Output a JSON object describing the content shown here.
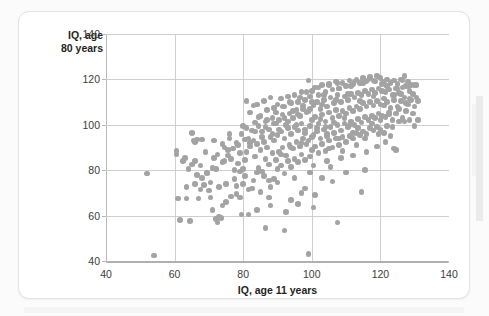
{
  "chart_data": {
    "type": "scatter",
    "title": "",
    "xlabel": "IQ, age 11 years",
    "ylabel": "IQ, age\n80 years",
    "xlim": [
      40,
      140
    ],
    "ylim": [
      40,
      140
    ],
    "xticks": [
      40,
      60,
      80,
      100,
      120,
      140
    ],
    "yticks": [
      40,
      60,
      80,
      100,
      120,
      140
    ],
    "grid": true,
    "legend": "none",
    "point_color": "#a3a3a3",
    "point_count": 497,
    "correlation_note": "strong positive association",
    "points": [
      [
        52.0,
        78.5
      ],
      [
        54.0,
        42.5
      ],
      [
        60.5,
        87.0
      ],
      [
        61.0,
        67.5
      ],
      [
        61.5,
        58.0
      ],
      [
        63.5,
        67.5
      ],
      [
        64.5,
        57.5
      ],
      [
        65.0,
        96.5
      ],
      [
        65.5,
        93.0
      ],
      [
        66.0,
        92.5
      ],
      [
        66.5,
        93.5
      ],
      [
        66.0,
        84.0
      ],
      [
        67.5,
        71.5
      ],
      [
        67.0,
        67.5
      ],
      [
        68.0,
        93.5
      ],
      [
        68.5,
        73.5
      ],
      [
        69.5,
        78.5
      ],
      [
        70.0,
        71.0
      ],
      [
        70.5,
        68.0
      ],
      [
        71.5,
        93.0
      ],
      [
        71.0,
        62.5
      ],
      [
        72.0,
        58.5
      ],
      [
        72.5,
        57.0
      ],
      [
        72.0,
        80.5
      ],
      [
        73.0,
        59.5
      ],
      [
        73.5,
        59.0
      ],
      [
        74.0,
        91.5
      ],
      [
        74.5,
        84.0
      ],
      [
        74.0,
        64.5
      ],
      [
        75.5,
        86.5
      ],
      [
        75.0,
        74.0
      ],
      [
        76.0,
        96.0
      ],
      [
        76.5,
        68.5
      ],
      [
        77.0,
        89.5
      ],
      [
        77.5,
        80.0
      ],
      [
        78.0,
        92.0
      ],
      [
        78.5,
        83.0
      ],
      [
        79.0,
        79.5
      ],
      [
        79.5,
        60.5
      ],
      [
        79.0,
        68.0
      ],
      [
        80.0,
        99.5
      ],
      [
        80.5,
        84.5
      ],
      [
        80.0,
        80.5
      ],
      [
        80.5,
        77.5
      ],
      [
        81.0,
        110.5
      ],
      [
        81.5,
        94.0
      ],
      [
        81.0,
        88.0
      ],
      [
        82.0,
        105.5
      ],
      [
        82.5,
        97.5
      ],
      [
        82.0,
        90.5
      ],
      [
        83.0,
        108.5
      ],
      [
        83.5,
        101.0
      ],
      [
        83.0,
        93.0
      ],
      [
        83.5,
        86.0
      ],
      [
        84.0,
        109.0
      ],
      [
        84.5,
        99.5
      ],
      [
        84.0,
        91.5
      ],
      [
        84.5,
        81.0
      ],
      [
        85.0,
        104.0
      ],
      [
        85.5,
        97.0
      ],
      [
        85.0,
        89.0
      ],
      [
        85.5,
        79.5
      ],
      [
        86.0,
        110.5
      ],
      [
        86.5,
        101.5
      ],
      [
        86.0,
        92.5
      ],
      [
        86.5,
        85.0
      ],
      [
        87.0,
        106.5
      ],
      [
        87.5,
        98.0
      ],
      [
        87.0,
        90.0
      ],
      [
        87.5,
        75.5
      ],
      [
        88.0,
        112.0
      ],
      [
        88.5,
        103.0
      ],
      [
        88.0,
        94.5
      ],
      [
        88.5,
        87.5
      ],
      [
        88.0,
        72.5
      ],
      [
        89.0,
        107.5
      ],
      [
        89.5,
        100.5
      ],
      [
        89.0,
        93.0
      ],
      [
        89.5,
        84.5
      ],
      [
        89.0,
        76.0
      ],
      [
        90.0,
        109.0
      ],
      [
        90.5,
        102.0
      ],
      [
        90.0,
        95.5
      ],
      [
        90.5,
        88.0
      ],
      [
        90.0,
        80.5
      ],
      [
        91.0,
        111.5
      ],
      [
        91.5,
        104.5
      ],
      [
        91.0,
        97.0
      ],
      [
        91.5,
        90.0
      ],
      [
        91.0,
        82.0
      ],
      [
        92.0,
        108.0
      ],
      [
        92.5,
        100.0
      ],
      [
        92.0,
        94.0
      ],
      [
        92.5,
        86.5
      ],
      [
        92.0,
        78.5
      ],
      [
        93.0,
        112.5
      ],
      [
        93.5,
        105.0
      ],
      [
        93.0,
        98.5
      ],
      [
        93.5,
        91.0
      ],
      [
        93.0,
        84.0
      ],
      [
        94.0,
        109.5
      ],
      [
        94.5,
        103.0
      ],
      [
        94.0,
        96.0
      ],
      [
        94.5,
        89.5
      ],
      [
        94.0,
        81.5
      ],
      [
        95.0,
        113.0
      ],
      [
        95.5,
        106.5
      ],
      [
        95.0,
        99.0
      ],
      [
        95.5,
        92.5
      ],
      [
        95.0,
        85.0
      ],
      [
        96.0,
        110.0
      ],
      [
        96.5,
        104.0
      ],
      [
        96.0,
        97.5
      ],
      [
        96.5,
        90.5
      ],
      [
        96.0,
        83.5
      ],
      [
        97.0,
        114.5
      ],
      [
        97.5,
        107.0
      ],
      [
        97.0,
        100.5
      ],
      [
        97.5,
        94.0
      ],
      [
        97.0,
        87.0
      ],
      [
        98.0,
        111.0
      ],
      [
        98.5,
        105.5
      ],
      [
        98.0,
        98.0
      ],
      [
        98.5,
        91.5
      ],
      [
        98.0,
        84.5
      ],
      [
        99.0,
        119.5
      ],
      [
        99.5,
        112.5
      ],
      [
        99.0,
        106.0
      ],
      [
        99.5,
        99.5
      ],
      [
        99.0,
        93.0
      ],
      [
        99.5,
        86.0
      ],
      [
        99.0,
        43.0
      ],
      [
        100.0,
        115.0
      ],
      [
        100.5,
        108.5
      ],
      [
        100.0,
        102.0
      ],
      [
        100.5,
        95.5
      ],
      [
        100.0,
        89.0
      ],
      [
        100.5,
        82.0
      ],
      [
        101.0,
        116.5
      ],
      [
        101.5,
        110.0
      ],
      [
        101.0,
        103.5
      ],
      [
        101.5,
        97.0
      ],
      [
        101.0,
        90.5
      ],
      [
        102.0,
        113.0
      ],
      [
        102.5,
        107.0
      ],
      [
        102.0,
        100.5
      ],
      [
        102.5,
        94.0
      ],
      [
        102.0,
        87.5
      ],
      [
        103.0,
        117.5
      ],
      [
        103.5,
        111.0
      ],
      [
        103.0,
        104.5
      ],
      [
        103.5,
        98.0
      ],
      [
        103.0,
        91.5
      ],
      [
        104.0,
        114.5
      ],
      [
        104.5,
        108.0
      ],
      [
        104.0,
        101.5
      ],
      [
        104.5,
        95.0
      ],
      [
        104.0,
        88.5
      ],
      [
        105.0,
        118.0
      ],
      [
        105.5,
        112.0
      ],
      [
        105.0,
        105.5
      ],
      [
        105.5,
        99.0
      ],
      [
        105.0,
        93.0
      ],
      [
        106.0,
        115.5
      ],
      [
        106.5,
        109.5
      ],
      [
        106.0,
        103.0
      ],
      [
        106.5,
        96.5
      ],
      [
        106.0,
        90.0
      ],
      [
        107.0,
        119.0
      ],
      [
        107.5,
        113.0
      ],
      [
        107.0,
        106.5
      ],
      [
        107.5,
        100.0
      ],
      [
        107.0,
        94.0
      ],
      [
        107.5,
        57.0
      ],
      [
        108.0,
        116.0
      ],
      [
        108.5,
        110.0
      ],
      [
        108.0,
        104.0
      ],
      [
        108.5,
        97.5
      ],
      [
        108.0,
        91.0
      ],
      [
        109.0,
        118.5
      ],
      [
        109.5,
        112.5
      ],
      [
        109.0,
        106.0
      ],
      [
        109.5,
        100.5
      ],
      [
        109.0,
        94.5
      ],
      [
        110.0,
        117.0
      ],
      [
        110.5,
        111.0
      ],
      [
        110.0,
        105.0
      ],
      [
        110.5,
        99.0
      ],
      [
        110.0,
        92.5
      ],
      [
        111.0,
        119.5
      ],
      [
        111.5,
        113.5
      ],
      [
        111.0,
        107.5
      ],
      [
        111.5,
        101.5
      ],
      [
        111.0,
        95.0
      ],
      [
        112.0,
        118.0
      ],
      [
        112.5,
        112.0
      ],
      [
        112.0,
        106.0
      ],
      [
        112.5,
        100.0
      ],
      [
        112.0,
        94.0
      ],
      [
        113.0,
        120.0
      ],
      [
        113.5,
        114.0
      ],
      [
        113.0,
        108.0
      ],
      [
        113.5,
        102.5
      ],
      [
        113.0,
        96.5
      ],
      [
        114.0,
        118.5
      ],
      [
        114.5,
        113.0
      ],
      [
        114.0,
        107.0
      ],
      [
        114.5,
        101.0
      ],
      [
        114.0,
        95.5
      ],
      [
        115.0,
        120.5
      ],
      [
        115.5,
        115.0
      ],
      [
        115.0,
        109.5
      ],
      [
        115.5,
        103.5
      ],
      [
        115.0,
        97.0
      ],
      [
        115.5,
        80.0
      ],
      [
        116.0,
        119.0
      ],
      [
        116.5,
        113.5
      ],
      [
        116.0,
        108.0
      ],
      [
        116.5,
        102.0
      ],
      [
        116.0,
        96.0
      ],
      [
        117.0,
        121.0
      ],
      [
        117.5,
        115.5
      ],
      [
        117.0,
        110.0
      ],
      [
        117.5,
        104.0
      ],
      [
        117.0,
        98.5
      ],
      [
        118.0,
        119.5
      ],
      [
        118.5,
        114.0
      ],
      [
        118.0,
        108.5
      ],
      [
        118.5,
        103.0
      ],
      [
        118.0,
        97.5
      ],
      [
        119.0,
        121.5
      ],
      [
        119.5,
        116.0
      ],
      [
        119.0,
        110.5
      ],
      [
        119.5,
        105.0
      ],
      [
        119.0,
        99.0
      ],
      [
        120.0,
        120.5
      ],
      [
        120.5,
        115.0
      ],
      [
        120.0,
        109.0
      ],
      [
        120.5,
        104.0
      ],
      [
        120.0,
        98.0
      ],
      [
        121.0,
        119.0
      ],
      [
        121.5,
        114.5
      ],
      [
        121.0,
        108.5
      ],
      [
        121.5,
        103.5
      ],
      [
        121.0,
        96.5
      ],
      [
        122.0,
        120.0
      ],
      [
        122.5,
        115.5
      ],
      [
        122.0,
        110.0
      ],
      [
        122.5,
        105.5
      ],
      [
        122.0,
        99.5
      ],
      [
        123.0,
        118.5
      ],
      [
        123.5,
        113.0
      ],
      [
        123.0,
        107.5
      ],
      [
        123.5,
        102.0
      ],
      [
        124.0,
        119.5
      ],
      [
        124.5,
        116.0
      ],
      [
        124.0,
        111.0
      ],
      [
        124.5,
        105.0
      ],
      [
        124.0,
        89.5
      ],
      [
        124.5,
        89.0
      ],
      [
        125.0,
        118.0
      ],
      [
        125.5,
        114.0
      ],
      [
        125.0,
        108.0
      ],
      [
        125.5,
        101.5
      ],
      [
        126.0,
        120.0
      ],
      [
        126.5,
        116.5
      ],
      [
        126.0,
        110.5
      ],
      [
        126.5,
        103.0
      ],
      [
        127.0,
        121.5
      ],
      [
        127.5,
        117.0
      ],
      [
        127.0,
        112.0
      ],
      [
        127.5,
        106.0
      ],
      [
        128.0,
        119.0
      ],
      [
        128.5,
        115.0
      ],
      [
        128.0,
        109.0
      ],
      [
        128.5,
        102.0
      ],
      [
        129.0,
        117.5
      ],
      [
        129.5,
        113.5
      ],
      [
        129.0,
        111.0
      ],
      [
        130.0,
        117.5
      ],
      [
        130.5,
        112.0
      ],
      [
        130.0,
        99.5
      ],
      [
        131.0,
        110.5
      ],
      [
        86.5,
        54.5
      ],
      [
        92.0,
        53.5
      ],
      [
        98.0,
        72.0
      ],
      [
        103.0,
        76.5
      ],
      [
        105.5,
        81.5
      ],
      [
        110.0,
        79.0
      ],
      [
        114.5,
        70.5
      ],
      [
        100.5,
        63.5
      ],
      [
        96.0,
        65.0
      ],
      [
        92.5,
        61.5
      ],
      [
        88.0,
        64.5
      ],
      [
        84.0,
        62.5
      ],
      [
        81.5,
        60.5
      ],
      [
        78.0,
        69.5
      ],
      [
        75.0,
        66.0
      ],
      [
        82.5,
        72.0
      ],
      [
        85.0,
        70.5
      ],
      [
        87.5,
        68.0
      ],
      [
        94.0,
        67.0
      ],
      [
        97.0,
        70.0
      ],
      [
        101.0,
        69.0
      ],
      [
        106.0,
        75.0
      ],
      [
        108.5,
        85.5
      ],
      [
        112.0,
        86.5
      ],
      [
        116.0,
        88.0
      ],
      [
        119.0,
        90.5
      ],
      [
        121.5,
        92.5
      ],
      [
        123.0,
        95.0
      ],
      [
        109.0,
        88.5
      ],
      [
        113.0,
        91.0
      ],
      [
        104.5,
        84.0
      ],
      [
        99.5,
        79.0
      ],
      [
        95.0,
        76.5
      ],
      [
        90.0,
        74.5
      ],
      [
        86.0,
        77.5
      ],
      [
        83.0,
        75.5
      ],
      [
        80.0,
        74.0
      ],
      [
        77.5,
        76.0
      ],
      [
        73.0,
        72.5
      ],
      [
        70.5,
        74.5
      ],
      [
        68.0,
        76.5
      ],
      [
        66.5,
        78.0
      ],
      [
        64.0,
        80.5
      ],
      [
        62.5,
        84.0
      ],
      [
        69.0,
        88.0
      ],
      [
        71.5,
        85.5
      ],
      [
        74.5,
        90.0
      ],
      [
        76.0,
        94.0
      ],
      [
        79.5,
        96.0
      ],
      [
        81.0,
        98.5
      ],
      [
        84.5,
        103.5
      ],
      [
        87.0,
        102.0
      ],
      [
        89.5,
        105.5
      ],
      [
        91.5,
        108.0
      ],
      [
        93.5,
        110.0
      ],
      [
        96.5,
        112.0
      ],
      [
        98.5,
        114.5
      ],
      [
        102.0,
        116.5
      ],
      [
        105.0,
        117.5
      ],
      [
        107.5,
        118.5
      ],
      [
        111.5,
        117.0
      ],
      [
        115.0,
        118.5
      ],
      [
        118.5,
        119.0
      ],
      [
        122.0,
        117.0
      ],
      [
        125.0,
        116.0
      ],
      [
        128.0,
        117.0
      ],
      [
        130.5,
        117.5
      ],
      [
        126.5,
        119.5
      ],
      [
        120.5,
        118.0
      ],
      [
        116.5,
        120.0
      ],
      [
        112.5,
        119.0
      ],
      [
        108.0,
        116.0
      ],
      [
        103.5,
        113.0
      ],
      [
        100.0,
        110.0
      ],
      [
        97.5,
        108.5
      ],
      [
        94.5,
        106.0
      ],
      [
        92.0,
        103.0
      ],
      [
        89.0,
        100.5
      ],
      [
        86.5,
        99.0
      ],
      [
        83.5,
        97.0
      ],
      [
        80.5,
        93.5
      ],
      [
        78.5,
        91.0
      ],
      [
        75.5,
        89.0
      ],
      [
        72.5,
        87.0
      ],
      [
        67.5,
        82.0
      ],
      [
        65.0,
        82.5
      ],
      [
        63.0,
        85.5
      ],
      [
        60.5,
        88.5
      ],
      [
        102.5,
        102.5
      ],
      [
        104.0,
        99.0
      ],
      [
        106.5,
        101.0
      ],
      [
        109.5,
        103.0
      ],
      [
        111.0,
        100.0
      ],
      [
        113.5,
        98.5
      ],
      [
        117.5,
        100.5
      ],
      [
        120.0,
        102.0
      ],
      [
        122.5,
        104.5
      ],
      [
        125.5,
        107.0
      ],
      [
        127.5,
        109.5
      ],
      [
        129.5,
        105.0
      ],
      [
        131.0,
        102.0
      ],
      [
        130.0,
        108.0
      ],
      [
        128.5,
        111.5
      ],
      [
        126.0,
        113.5
      ],
      [
        124.0,
        113.0
      ],
      [
        121.0,
        111.5
      ],
      [
        118.0,
        112.5
      ],
      [
        114.0,
        110.5
      ],
      [
        110.5,
        113.5
      ],
      [
        107.0,
        111.0
      ],
      [
        103.0,
        109.0
      ],
      [
        99.5,
        107.0
      ],
      [
        96.0,
        104.5
      ],
      [
        93.0,
        101.5
      ],
      [
        90.5,
        98.0
      ],
      [
        88.5,
        96.0
      ],
      [
        85.5,
        94.5
      ],
      [
        82.0,
        92.0
      ],
      [
        79.0,
        87.5
      ],
      [
        76.5,
        85.0
      ],
      [
        74.0,
        83.5
      ],
      [
        71.0,
        81.0
      ],
      [
        69.5,
        79.0
      ],
      [
        66.0,
        74.0
      ],
      [
        63.5,
        72.5
      ],
      [
        95.5,
        100.0
      ],
      [
        98.0,
        96.5
      ],
      [
        101.5,
        98.5
      ],
      [
        104.5,
        96.0
      ],
      [
        100.0,
        94.5
      ],
      [
        97.0,
        92.0
      ],
      [
        94.0,
        90.0
      ],
      [
        91.0,
        87.0
      ],
      [
        87.5,
        82.5
      ],
      [
        84.0,
        79.0
      ],
      [
        81.5,
        71.5
      ],
      [
        78.0,
        73.0
      ],
      [
        105.0,
        89.5
      ],
      [
        108.0,
        94.0
      ],
      [
        112.0,
        96.5
      ],
      [
        115.5,
        94.0
      ],
      [
        119.5,
        96.0
      ],
      [
        123.5,
        99.0
      ],
      [
        127.0,
        101.5
      ]
    ]
  }
}
